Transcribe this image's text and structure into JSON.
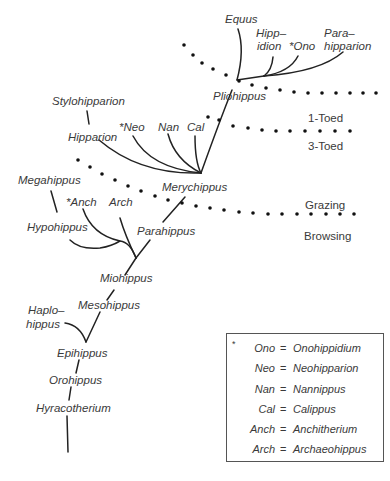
{
  "diagram": {
    "taxa": {
      "equus": "Equus",
      "hippidion_1": "Hipp–",
      "hippidion_2": "idion",
      "ono": "*Ono",
      "parahipparion_1": "Para–",
      "parahipparion_2": "hipparion",
      "pliohippus": "Pliohippus",
      "stylohipparion": "Stylohipparion",
      "hipparion": "Hipparion",
      "neo": "*Neo",
      "nan": "Nan",
      "cal": "Cal",
      "merychippus": "Merychippus",
      "megahippus": "Megahippus",
      "anch": "*Anch",
      "arch": "Arch",
      "hypohippus": "Hypohippus",
      "parahippus": "Parahippus",
      "miohippus": "Miohippus",
      "haplohippus_1": "Haplo–",
      "haplohippus_2": "hippus",
      "mesohippus": "Mesohippus",
      "epihippus": "Epihippus",
      "orohippus": "Orohippus",
      "hyracotherium": "Hyracotherium"
    },
    "divisions": {
      "toe_upper": "1-Toed",
      "toe_lower": "3-Toed",
      "diet_upper": "Grazing",
      "diet_lower": "Browsing"
    },
    "legend": {
      "star": "*",
      "items": [
        {
          "abbr": "Ono",
          "eq": "=",
          "full": "Onohippidium"
        },
        {
          "abbr": "Neo",
          "eq": "=",
          "full": "Neohipparion"
        },
        {
          "abbr": "Nan",
          "eq": "=",
          "full": "Nannippus"
        },
        {
          "abbr": "Cal",
          "eq": "=",
          "full": "Calippus"
        },
        {
          "abbr": "Anch",
          "eq": "=",
          "full": "Anchitherium"
        },
        {
          "abbr": "Arch",
          "eq": "=",
          "full": "Archaeohippus"
        }
      ]
    }
  }
}
